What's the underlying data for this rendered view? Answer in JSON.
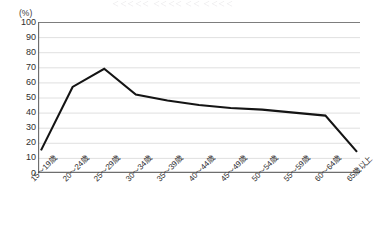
{
  "title_remnant": "＜＜＜＜＜  ＜＜＜＜   ＜＜  ＜＜＜＜",
  "axis": {
    "unit_label": "(%)",
    "y_ticks": [
      "100",
      "90",
      "80",
      "70",
      "60",
      "50",
      "40",
      "30",
      "20",
      "10",
      "0"
    ],
    "x_ticks": [
      "15～19歳",
      "20～24歳",
      "25～29歳",
      "30～34歳",
      "35～39歳",
      "40～44歳",
      "45～49歳",
      "50～54歳",
      "55～59歳",
      "60～64歳",
      "65歳以上"
    ]
  },
  "style": {
    "line_color": "#141414",
    "grid_color": "#d8d8d8",
    "axis_color": "#6e6e6e",
    "background": "#ffffff"
  },
  "chart_data": {
    "type": "line",
    "title": "",
    "xlabel": "",
    "ylabel": "(%)",
    "ylim": [
      0,
      100
    ],
    "ytick_step": 10,
    "grid": true,
    "legend": "none",
    "categories": [
      "15～19歳",
      "20～24歳",
      "25～29歳",
      "30～34歳",
      "35～39歳",
      "40～44歳",
      "45～49歳",
      "50～54歳",
      "55～59歳",
      "60～64歳",
      "65歳以上"
    ],
    "series": [
      {
        "name": "比率",
        "values": [
          15,
          57,
          69,
          52,
          48,
          45,
          43,
          42,
          40,
          38,
          14
        ]
      }
    ]
  }
}
